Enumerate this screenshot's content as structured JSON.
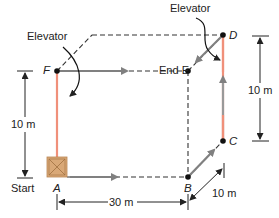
{
  "diagram": {
    "type": "3D path displacement diagram (box moved through a rectangular volume)",
    "colors": {
      "elevator_path": "#f0907a",
      "move_arrow": "#808080",
      "dashed_edge": "#333333",
      "dimension_line": "#222222",
      "crate": "#d9a877"
    },
    "points": {
      "A": {
        "label": "A"
      },
      "B": {
        "label": "B"
      },
      "C": {
        "label": "C"
      },
      "D": {
        "label": "D"
      },
      "E": {
        "label": "End E"
      },
      "F": {
        "label": "F"
      }
    },
    "labels": {
      "start": "Start",
      "elevator_left": "Elevator",
      "elevator_right": "Elevator"
    },
    "dimensions": {
      "left_height": "10 m",
      "right_height": "10 m",
      "bottom_width": "30 m",
      "depth": "10 m"
    },
    "path": [
      "A",
      "B",
      "C",
      "D",
      "E"
    ],
    "alternate_elevator": [
      "A",
      "F"
    ]
  }
}
